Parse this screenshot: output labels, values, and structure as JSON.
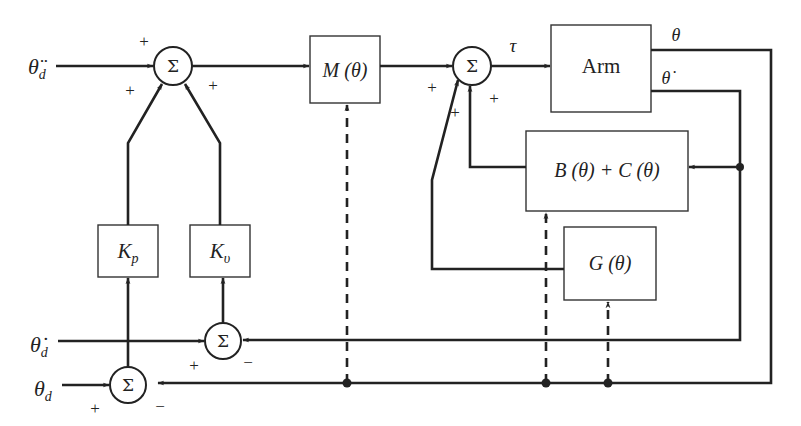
{
  "inputs": {
    "accel_desired": "θ̈",
    "accel_desired_sub": "d",
    "vel_desired": "θ̇",
    "vel_desired_sub": "d",
    "pos_desired": "θ",
    "pos_desired_sub": "d"
  },
  "blocks": {
    "mass_matrix": "M (θ)",
    "arm": "Arm",
    "coriolis": "B (θ) + C (θ)",
    "gravity": "G (θ)",
    "kp_main": "K",
    "kp_sub": "p",
    "kv_main": "K",
    "kv_sub": "υ"
  },
  "summers": {
    "symbol": "Σ",
    "sum1_signs": [
      "+",
      "+",
      "+"
    ],
    "sum2_signs": [
      "+",
      "+",
      "+"
    ],
    "sum3_signs": [
      "+",
      "−"
    ],
    "sum4_signs": [
      "+",
      "−"
    ]
  },
  "signals": {
    "torque": "τ",
    "position": "θ",
    "velocity": "θ̇"
  },
  "colors": {
    "line": "#222222",
    "box_border": "#333333",
    "background": "#ffffff"
  }
}
